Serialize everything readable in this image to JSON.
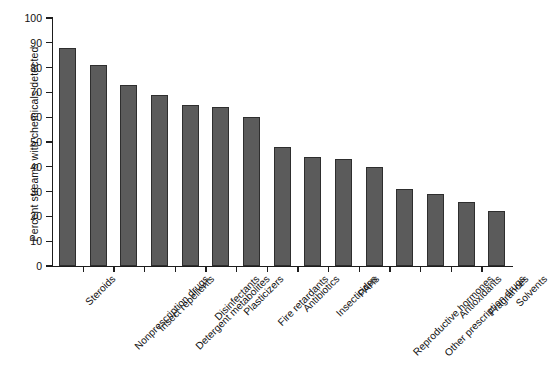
{
  "chart_data": {
    "type": "bar",
    "title": "",
    "subtitle": "",
    "xlabel": "",
    "ylabel": "Percent streams with chemicals detected",
    "ylim": [
      0,
      100
    ],
    "ytick_step": 10,
    "yticks": [
      0,
      10,
      20,
      30,
      40,
      50,
      60,
      70,
      80,
      90,
      100
    ],
    "grid": false,
    "legend": false,
    "bar_color": "#5b5b5b",
    "bar_edge_color": "#2e2e2e",
    "background": "#ffffff",
    "categories": [
      "Steroids",
      "Nonprescription drugs",
      "Insect repellents",
      "Detergent metabolites",
      "Disinfectants",
      "Plasticizers",
      "Fire retardants",
      "Antibiotics",
      "Insecticides",
      "PAHs",
      "Reproductive hormones",
      "Other prescription drugs",
      "Antioxidants",
      "Fragrances",
      "Solvents"
    ],
    "values": [
      88,
      81,
      73,
      69,
      65,
      64,
      60,
      48,
      44,
      43,
      40,
      31,
      29,
      26,
      22
    ]
  }
}
